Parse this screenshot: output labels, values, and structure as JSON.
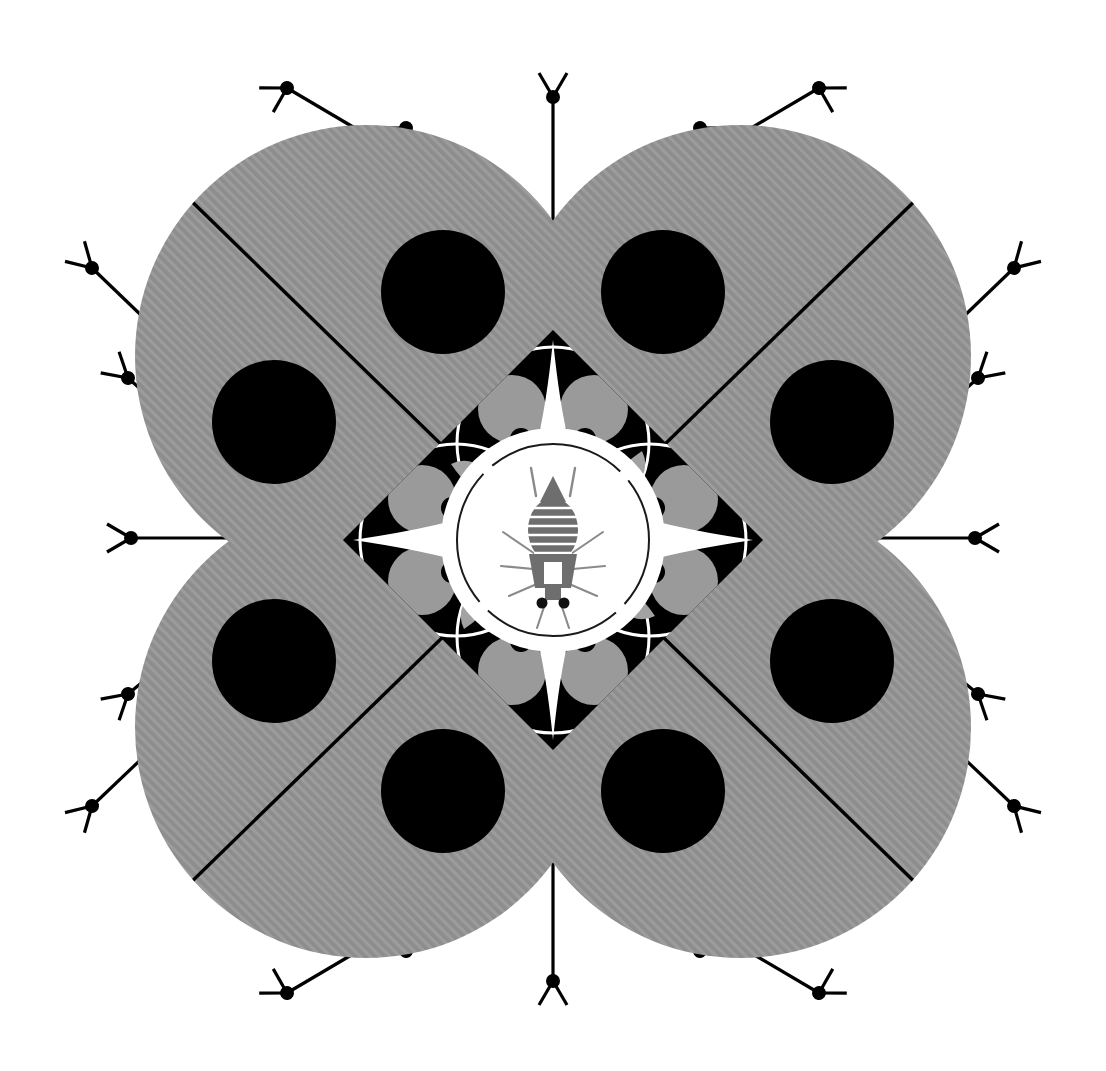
{
  "artwork": {
    "title": "Radial Symmetric Insect Mandala",
    "description": "Four-fold rotationally symmetric black-and-white graphic composition with four large hatched gray discs, a central black diamond containing a white four-pointed star, and a bee-like insect figure at center.",
    "canvas": {
      "width": 1106,
      "height": 1071,
      "background": "#ffffff"
    },
    "center": {
      "x": 553,
      "y": 540
    }
  },
  "palette": {
    "background": "#ffffff",
    "gray_fill": "#909090",
    "gray_hatch": "#9b9b9b",
    "black": "#000000",
    "inner_gray_circle": "#9a9a9a",
    "lens_gray": "#a0a0a0",
    "insect_gray": "#6e6e6e",
    "insect_stripe": "#595959",
    "white": "#ffffff"
  },
  "layers": {
    "outer_antennae": {
      "name": "outer-tripod-antennae",
      "count": 20,
      "node_radius": 7,
      "stem_width": 3,
      "arm_length": 26,
      "description": "Line segments radiating outward from the four gray discs, each terminating in a filled black dot with two short perpendicular branch arms forming a tripod/Y shape."
    },
    "gray_discs": {
      "name": "hatched-gray-discs",
      "count": 4,
      "radius": 231,
      "centers": [
        {
          "id": "top-left",
          "x": 366,
          "y": 356
        },
        {
          "id": "top-right",
          "x": 740,
          "y": 356
        },
        {
          "id": "bottom-left",
          "x": 366,
          "y": 727
        },
        {
          "id": "bottom-right",
          "x": 740,
          "y": 727
        }
      ],
      "hatch_spacing": 7,
      "hatch_angle_deg": 45,
      "black_dots_per_disc": 2,
      "black_dot_radius": 62,
      "divider_line_width": 3,
      "description": "Each disc is filled with fine diagonal hatching, crossed by a single black diagonal chord line, and carries two solid black circular dots."
    },
    "diamond": {
      "name": "central-black-diamond",
      "half_diagonal": 210,
      "fill": "#000000",
      "description": "Black square rotated 45 degrees centered on the composition."
    },
    "star": {
      "name": "white-four-pointed-star",
      "point_length": 182,
      "fill": "#ffffff",
      "description": "Concave four-pointed white star with needle-sharp points aimed at the diamond vertices."
    },
    "inner_rings": {
      "name": "white-ring-outlines",
      "count": 4,
      "radius": 96,
      "stroke": "#ffffff",
      "stroke_width": 3,
      "offset": 97,
      "description": "Four thin white circular outlines arranged around the center inside the black diamond."
    },
    "corner_gray_circles": {
      "name": "gray-accent-circles",
      "count": 8,
      "radius": 34,
      "fill": "#9a9a9a",
      "description": "Eight mid-gray circles placed in pairs near the four vertices of the black diamond."
    },
    "lens_shapes": {
      "name": "gray-lens-leaves",
      "count": 4,
      "fill": "#a0a0a0",
      "description": "Four pointed lens / leaf shapes inside the black field, oriented diagonally."
    },
    "junction_dots": {
      "name": "black-junction-dots",
      "count": 8,
      "radius": 11,
      "fill": "#000000",
      "description": "Eight small black dots sitting on the white star where the ring outlines intersect."
    },
    "center_circle": {
      "name": "center-outlined-circle",
      "radius": 112,
      "fill": "#ffffff",
      "stroke": "#1a1a1a",
      "stroke_width": 2,
      "dash": "broken at four cardinal points",
      "description": "White circle with a thin dark outline broken by four small gaps."
    },
    "insect": {
      "name": "central-insect-figure",
      "kind": "bee-wasp",
      "fill": "#6e6e6e",
      "parts": [
        "triangular-head",
        "two-antennae",
        "striped-abdomen",
        "thorax-with-square-marking",
        "six-radiating-legs",
        "two-black-eye-dots"
      ],
      "abdomen_stripes": 6,
      "description": "Stylized gray insect viewed from above: pointed triangular head, pair of antennae, horizontally banded oval abdomen, thorax bearing a rectangular notch, and thin legs splayed outward."
    }
  }
}
